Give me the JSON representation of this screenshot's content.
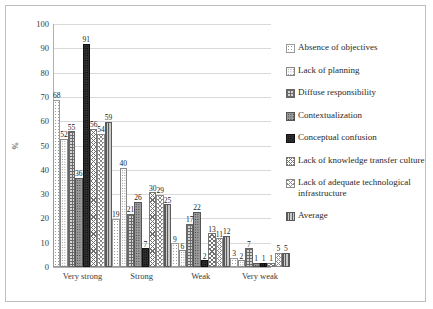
{
  "chart_data": {
    "type": "bar",
    "title": "",
    "xlabel": "",
    "ylabel": "%",
    "ylim": [
      0,
      100
    ],
    "ytick_step": 10,
    "yticks": [
      "100",
      "90",
      "80",
      "70",
      "60",
      "50",
      "40",
      "30",
      "20",
      "10",
      "0"
    ],
    "grid": true,
    "legend_position": "right",
    "categories": [
      "Very strong",
      "Strong",
      "Weak",
      "Very weak"
    ],
    "series": [
      {
        "name": "Absence of objectives",
        "values": [
          68,
          19,
          9,
          3
        ]
      },
      {
        "name": "Lack of planning",
        "values": [
          52,
          40,
          6,
          2
        ]
      },
      {
        "name": "Diffuse responsibility",
        "values": [
          55,
          21,
          17,
          7
        ]
      },
      {
        "name": "Contextualization",
        "values": [
          36,
          26,
          22,
          1
        ]
      },
      {
        "name": "Conceptual confusion",
        "values": [
          91,
          7,
          2,
          1
        ]
      },
      {
        "name": "Lack of knowledge transfer culture",
        "values": [
          56,
          30,
          13,
          1
        ]
      },
      {
        "name": "Lack of adequate technological infrastructure",
        "values": [
          54,
          29,
          11,
          5
        ]
      },
      {
        "name": "Average",
        "values": [
          59,
          25,
          12,
          5
        ]
      }
    ]
  },
  "legend": {
    "items": [
      {
        "label": "Absence of objectives"
      },
      {
        "label": "Lack of planning"
      },
      {
        "label": "Diffuse responsibility"
      },
      {
        "label": "Contextualization"
      },
      {
        "label": "Conceptual confusion"
      },
      {
        "label": "Lack of knowledge transfer culture"
      },
      {
        "label": "Lack of adequate technological infrastructure"
      },
      {
        "label": "Average"
      }
    ]
  }
}
